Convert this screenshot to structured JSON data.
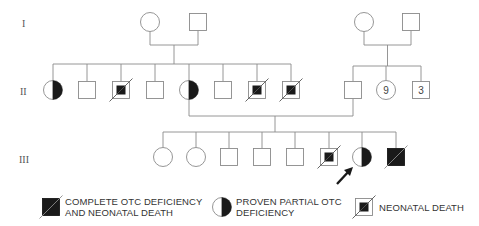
{
  "generations": [
    {
      "label": "I",
      "y": 24
    },
    {
      "label": "II",
      "y": 92
    },
    {
      "label": "III",
      "y": 160
    }
  ],
  "colors": {
    "line": "#8a8a8a",
    "fill": "#1a1a1a",
    "arrow": "#1a1a1a"
  },
  "gen1": {
    "left_couple": [
      {
        "sex": "female",
        "x": 150,
        "y": 22,
        "status": "unaffected"
      },
      {
        "sex": "male",
        "x": 198,
        "y": 22,
        "status": "unaffected"
      }
    ],
    "right_couple": [
      {
        "sex": "female",
        "x": 364,
        "y": 22,
        "status": "unaffected"
      },
      {
        "sex": "male",
        "x": 411,
        "y": 22,
        "status": "unaffected"
      }
    ]
  },
  "gen2": {
    "left_sibship": [
      {
        "sex": "female",
        "x": 53,
        "status": "partial_otc_deficiency"
      },
      {
        "sex": "male",
        "x": 87,
        "status": "unaffected"
      },
      {
        "sex": "male",
        "x": 121,
        "status": "neonatal_death"
      },
      {
        "sex": "male",
        "x": 155,
        "status": "unaffected"
      },
      {
        "sex": "female",
        "x": 189,
        "status": "partial_otc_deficiency"
      },
      {
        "sex": "male",
        "x": 223,
        "status": "unaffected"
      },
      {
        "sex": "male",
        "x": 257,
        "status": "neonatal_death"
      },
      {
        "sex": "male",
        "x": 291,
        "status": "neonatal_death"
      }
    ],
    "right_sibship": [
      {
        "sex": "male",
        "x": 353,
        "status": "unaffected"
      },
      {
        "sex": "female",
        "x": 386,
        "status": "unaffected",
        "count": "9"
      },
      {
        "sex": "male",
        "x": 421,
        "status": "unaffected",
        "count": "3"
      }
    ]
  },
  "gen3": [
    {
      "sex": "female",
      "x": 163,
      "status": "unaffected"
    },
    {
      "sex": "female",
      "x": 196,
      "status": "unaffected"
    },
    {
      "sex": "male",
      "x": 229,
      "status": "unaffected"
    },
    {
      "sex": "male",
      "x": 262,
      "status": "unaffected"
    },
    {
      "sex": "male",
      "x": 295,
      "status": "unaffected"
    },
    {
      "sex": "male",
      "x": 329,
      "status": "neonatal_death"
    },
    {
      "sex": "female",
      "x": 362,
      "status": "partial_otc_deficiency",
      "proband": true
    },
    {
      "sex": "male",
      "x": 396,
      "status": "complete_otc_deficiency_neonatal_death"
    }
  ],
  "legend": [
    {
      "symbol": "complete_otc_deficiency_neonatal_death",
      "line1": "COMPLETE OTC DEFICIENCY",
      "line2": "AND NEONATAL DEATH"
    },
    {
      "symbol": "partial_otc_deficiency",
      "line1": "PROVEN PARTIAL OTC",
      "line2": "DEFICIENCY"
    },
    {
      "symbol": "neonatal_death",
      "line1": "NEONATAL DEATH",
      "line2": ""
    }
  ]
}
